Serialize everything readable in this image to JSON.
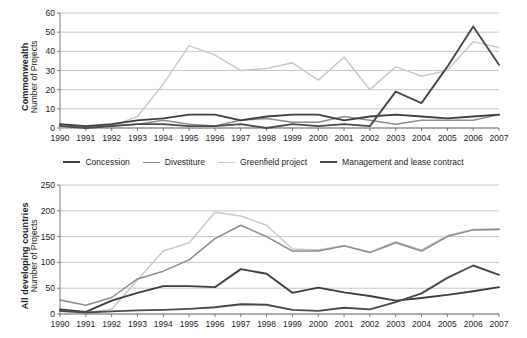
{
  "chart_data": [
    {
      "id": "commonwealth",
      "type": "line",
      "title": "",
      "xlabel": "",
      "ylabel": "Commonwealth",
      "ylabel_sub": "Number of Projects",
      "ylim": [
        0,
        60
      ],
      "yticks": [
        0,
        10,
        20,
        30,
        40,
        50,
        60
      ],
      "grid": true,
      "legend_position": "below",
      "x": [
        1990,
        1991,
        1992,
        1993,
        1994,
        1995,
        1996,
        1997,
        1998,
        1999,
        2000,
        2001,
        2002,
        2003,
        2004,
        2005,
        2006,
        2007
      ],
      "categories": [
        "1990",
        "1991",
        "1992",
        "1993",
        "1994",
        "1995",
        "1996",
        "1997",
        "1998",
        "1999",
        "2000",
        "2001",
        "2002",
        "2003",
        "2004",
        "2005",
        "2006",
        "2007"
      ],
      "series": [
        {
          "name": "Concession",
          "color": "#3f3f3f",
          "width": 1.9,
          "values": [
            2,
            1,
            2,
            4,
            5,
            7,
            7,
            4,
            6,
            7,
            7,
            4,
            6,
            7,
            6,
            5,
            6,
            7
          ]
        },
        {
          "name": "Divestiture",
          "color": "#8c8c8c",
          "width": 1.5,
          "values": [
            1,
            1,
            1,
            2,
            4,
            2,
            1,
            4,
            5,
            3,
            3,
            6,
            4,
            2,
            4,
            4,
            4,
            7
          ]
        },
        {
          "name": "Greenfield project",
          "color": "#c9c9c9",
          "width": 1.5,
          "values": [
            0,
            0,
            1,
            6,
            23,
            43,
            38,
            30,
            31,
            34,
            25,
            37,
            20,
            32,
            27,
            30,
            45,
            42
          ]
        },
        {
          "name": "Management and lease contract",
          "color": "#4a4a4a",
          "width": 1.9,
          "values": [
            1,
            0,
            1,
            2,
            2,
            1,
            1,
            2,
            0,
            2,
            1,
            2,
            1,
            19,
            13,
            32,
            53,
            33
          ]
        }
      ]
    },
    {
      "id": "all-developing-countries",
      "type": "line",
      "title": "",
      "xlabel": "",
      "ylabel": "All developing countries",
      "ylabel_sub": "Number of Projects",
      "ylim": [
        0,
        250
      ],
      "yticks": [
        0,
        50,
        100,
        150,
        200,
        250
      ],
      "grid": true,
      "legend_position": "shared-above",
      "x": [
        1990,
        1991,
        1992,
        1993,
        1994,
        1995,
        1996,
        1997,
        1998,
        1999,
        2000,
        2001,
        2002,
        2003,
        2004,
        2005,
        2006,
        2007
      ],
      "categories": [
        "1990",
        "1991",
        "1992",
        "1993",
        "1994",
        "1995",
        "1996",
        "1997",
        "1998",
        "1999",
        "2000",
        "2001",
        "2002",
        "2003",
        "2004",
        "2005",
        "2006",
        "2007"
      ],
      "series": [
        {
          "name": "Concession",
          "color": "#3f3f3f",
          "width": 1.9,
          "values": [
            9,
            4,
            26,
            41,
            54,
            54,
            52,
            87,
            78,
            41,
            51,
            42,
            35,
            26,
            31,
            37,
            44,
            52
          ]
        },
        {
          "name": "Divestiture",
          "color": "#8c8c8c",
          "width": 1.5,
          "values": [
            27,
            17,
            32,
            68,
            83,
            105,
            146,
            172,
            150,
            122,
            122,
            132,
            119,
            138,
            122,
            150,
            163,
            164
          ]
        },
        {
          "name": "Greenfield project",
          "color": "#c9c9c9",
          "width": 1.5,
          "values": [
            5,
            3,
            9,
            66,
            122,
            138,
            197,
            190,
            172,
            126,
            124,
            133,
            120,
            140,
            124,
            152,
            164,
            165
          ]
        },
        {
          "name": "Management and lease contract",
          "color": "#4a4a4a",
          "width": 1.9,
          "values": [
            6,
            3,
            5,
            7,
            8,
            10,
            13,
            19,
            18,
            8,
            6,
            12,
            9,
            23,
            40,
            70,
            94,
            76
          ]
        }
      ]
    }
  ],
  "legend": {
    "items": [
      {
        "label": "Concession",
        "color": "#3f3f3f"
      },
      {
        "label": "Divestiture",
        "color": "#8c8c8c"
      },
      {
        "label": "Greenfield project",
        "color": "#c9c9c9"
      },
      {
        "label": "Management and lease contract",
        "color": "#4a4a4a"
      }
    ]
  },
  "colors": {
    "grid": "#b9b9b9",
    "axis": "#6d6d6d",
    "text": "#231f20",
    "background": "#ffffff"
  }
}
